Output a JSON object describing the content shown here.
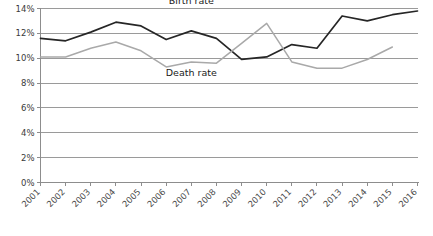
{
  "chart_data": {
    "type": "line",
    "title": "",
    "xlabel": "",
    "ylabel": "",
    "ylim": [
      0,
      14
    ],
    "ytick_values": [
      0,
      2,
      4,
      6,
      8,
      10,
      12,
      14
    ],
    "ytick_labels": [
      "0%",
      "2%",
      "4%",
      "6%",
      "8%",
      "10%",
      "12%",
      "14%"
    ],
    "grid": true,
    "legend_position": "inline-annotation",
    "categories": [
      "2001",
      "2002",
      "2003",
      "2004",
      "2005",
      "2006",
      "2007",
      "2008",
      "2009",
      "2010",
      "2011",
      "2012",
      "2013",
      "2014",
      "2015",
      "2016"
    ],
    "series": [
      {
        "name": "Birth rate",
        "color": "#262626",
        "values": [
          11.6,
          11.4,
          12.1,
          12.9,
          12.6,
          11.5,
          12.2,
          11.6,
          9.9,
          10.1,
          11.1,
          10.8,
          13.4,
          13.0,
          13.5,
          13.8
        ]
      },
      {
        "name": "Death rate",
        "color": "#a9a9a9",
        "values": [
          10.1,
          10.1,
          10.8,
          11.3,
          10.6,
          9.3,
          9.7,
          9.6,
          11.2,
          12.8,
          9.7,
          9.2,
          9.2,
          9.9,
          10.9,
          null
        ]
      }
    ],
    "annotations": [
      {
        "text": "Birth rate",
        "x_value": "2007",
        "y_value": 14.4
      },
      {
        "text": "Death rate",
        "x_value": "2007",
        "y_value": 8.6
      }
    ]
  },
  "axes": {
    "y_max_label": "14%",
    "y_min_label": "0%",
    "x_first_label": "2001",
    "x_last_label": "2016"
  },
  "colors": {
    "birth_rate": "#262626",
    "death_rate": "#a9a9a9",
    "gridline": "#9a9a9a",
    "axis": "#8d8d8d",
    "background": "#ffffff",
    "text": "#3a3a3a"
  }
}
